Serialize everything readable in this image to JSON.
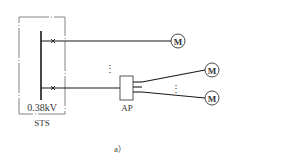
{
  "diagram": {
    "caption": "a）",
    "sts": {
      "voltage_label": "0.38kV",
      "name": "STS"
    },
    "ap": {
      "label": "AP"
    },
    "motors": [
      {
        "label": "M"
      },
      {
        "label": "M"
      },
      {
        "label": "M"
      }
    ],
    "ellipsis": "⋮",
    "colors": {
      "line": "#1a1a1a",
      "dashed_box": "#777777",
      "text": "#333333"
    }
  }
}
